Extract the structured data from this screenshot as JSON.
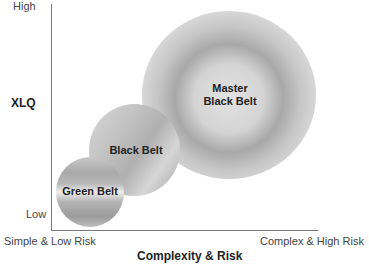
{
  "diagram": {
    "y_axis": {
      "title": "XLQ",
      "high_label": "High",
      "low_label": "Low"
    },
    "x_axis": {
      "title": "Complexity & Risk",
      "low_label": "Simple & Low Risk",
      "high_label": "Complex & High Risk"
    },
    "circles": [
      {
        "label": "Green Belt",
        "size": "small"
      },
      {
        "label": "Black Belt",
        "size": "medium"
      },
      {
        "label_line1": "Master",
        "label_line2": "Black Belt",
        "size": "large"
      }
    ]
  }
}
